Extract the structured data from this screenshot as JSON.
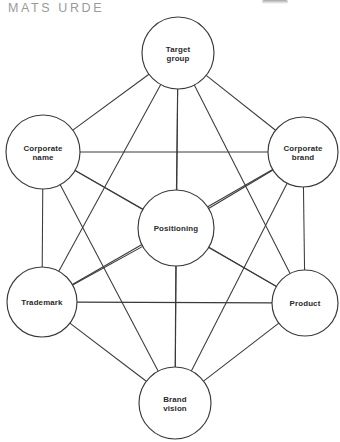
{
  "header": {
    "attribution": "MATS URDE",
    "smudge_icon": "partial-mark-icon"
  },
  "diagram": {
    "type": "complete-graph",
    "node_count": 7,
    "edge_count": 21,
    "stroke_color": "#3a3a3a",
    "fill_color": "#ffffff",
    "text_color": "#2b2b2b",
    "nodes": [
      {
        "id": "target-group",
        "label_line1": "Target",
        "label_line2": "group",
        "cx": 178,
        "cy": 53,
        "r": 36
      },
      {
        "id": "corporate-name",
        "label_line1": "Corporate",
        "label_line2": "name",
        "cx": 43,
        "cy": 152,
        "r": 37
      },
      {
        "id": "corporate-brand",
        "label_line1": "Corporate",
        "label_line2": "brand",
        "cx": 303,
        "cy": 152,
        "r": 35
      },
      {
        "id": "positioning",
        "label_line1": "Positioning",
        "label_line2": "",
        "cx": 176,
        "cy": 228,
        "r": 38
      },
      {
        "id": "trademark",
        "label_line1": "Trademark",
        "label_line2": "",
        "cx": 42,
        "cy": 302,
        "r": 35
      },
      {
        "id": "product",
        "label_line1": "Product",
        "label_line2": "",
        "cx": 305,
        "cy": 303,
        "r": 33
      },
      {
        "id": "brand-vision",
        "label_line1": "Brand",
        "label_line2": "vision",
        "cx": 175,
        "cy": 403,
        "r": 36
      }
    ],
    "edges": [
      [
        "target-group",
        "corporate-name"
      ],
      [
        "target-group",
        "corporate-brand"
      ],
      [
        "target-group",
        "positioning"
      ],
      [
        "target-group",
        "trademark"
      ],
      [
        "target-group",
        "product"
      ],
      [
        "target-group",
        "brand-vision"
      ],
      [
        "corporate-name",
        "corporate-brand"
      ],
      [
        "corporate-name",
        "positioning"
      ],
      [
        "corporate-name",
        "trademark"
      ],
      [
        "corporate-name",
        "product"
      ],
      [
        "corporate-name",
        "brand-vision"
      ],
      [
        "corporate-brand",
        "positioning"
      ],
      [
        "corporate-brand",
        "trademark"
      ],
      [
        "corporate-brand",
        "product"
      ],
      [
        "corporate-brand",
        "brand-vision"
      ],
      [
        "positioning",
        "trademark"
      ],
      [
        "positioning",
        "product"
      ],
      [
        "positioning",
        "brand-vision"
      ],
      [
        "trademark",
        "product"
      ],
      [
        "trademark",
        "brand-vision"
      ],
      [
        "product",
        "brand-vision"
      ]
    ]
  }
}
